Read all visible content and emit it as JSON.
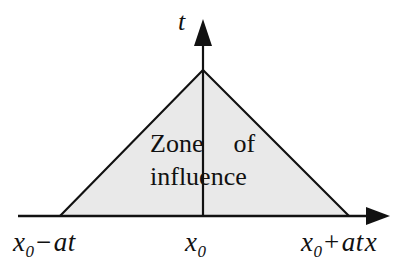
{
  "figure": {
    "background_color": "#ffffff",
    "line_color": "#111111",
    "zone_fill_color": "#e9e9e9"
  },
  "axes": {
    "vertical": {
      "label": "t",
      "name": "time-axis",
      "arrow": "up"
    },
    "horizontal": {
      "label": "x",
      "name": "space-axis",
      "arrow": "right"
    }
  },
  "zone": {
    "line_1_word_1": "Zone",
    "line_1_word_2": "of",
    "line_2": "influence"
  },
  "tick_labels": {
    "left": {
      "base": "x",
      "subscript": "0",
      "operator": "−",
      "term": "at"
    },
    "center": {
      "base": "x",
      "subscript": "0"
    },
    "right": {
      "base": "x",
      "subscript": "0",
      "operator": "+",
      "term": "at",
      "axis_label": "x"
    }
  },
  "geometry": {
    "apex": [
      203,
      70
    ],
    "base_left": [
      60,
      216
    ],
    "base_right": [
      349,
      216
    ],
    "x_axis_y": 216,
    "t_axis_x": 203
  }
}
